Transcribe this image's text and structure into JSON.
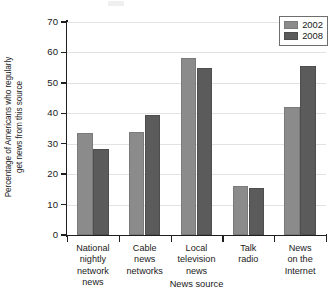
{
  "chart_data": {
    "type": "bar",
    "title": "",
    "xlabel": "News source",
    "ylabel": "Percentage of Americans who regularly get news from this source",
    "ylim": [
      0,
      70
    ],
    "yticks": [
      0,
      10,
      20,
      30,
      40,
      50,
      60,
      70
    ],
    "grid": true,
    "legend_position": "top-right",
    "categories": [
      "National nightly network news",
      "Cable news networks",
      "Local television news",
      "Talk radio",
      "News on the Internet"
    ],
    "category_lines": [
      [
        "National",
        "nightly",
        "network",
        "news"
      ],
      [
        "Cable",
        "news",
        "networks"
      ],
      [
        "Local",
        "television",
        "news"
      ],
      [
        "Talk",
        "radio"
      ],
      [
        "News",
        "on the",
        "Internet"
      ]
    ],
    "series": [
      {
        "name": "2002",
        "color": "#8b8b8b",
        "values": [
          33.4,
          33.8,
          58.2,
          16.0,
          42.1
        ]
      },
      {
        "name": "2008",
        "color": "#5b5b5b",
        "values": [
          28.2,
          39.5,
          55.0,
          15.5,
          55.7
        ]
      }
    ]
  },
  "ylabel_lines": [
    "Percentage of Americans who regularly",
    "get news from this source"
  ],
  "legend": {
    "items": [
      {
        "label": "2002",
        "key": "y2002"
      },
      {
        "label": "2008",
        "key": "y2008"
      }
    ]
  }
}
